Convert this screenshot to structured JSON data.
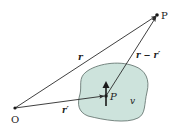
{
  "diagram": {
    "title": "",
    "colors": {
      "background": "#ffffff",
      "line": "#2a2a2a",
      "region_fill": "#cde3dc",
      "region_stroke": "#5a6b66",
      "text": "#222222"
    },
    "points": {
      "origin": {
        "label": "O",
        "x": 15,
        "y": 108
      },
      "field_point": {
        "label": "P",
        "x": 157,
        "y": 15
      },
      "source_point": {
        "label": "P",
        "x": 106,
        "y": 96
      }
    },
    "vectors": {
      "r": {
        "label": "r",
        "from": "origin",
        "to": "field_point"
      },
      "r_prime": {
        "label": "r′",
        "from": "origin",
        "to": "source_point"
      },
      "r_minus_r_prime": {
        "label": "r − r′",
        "from": "source_point",
        "to": "field_point"
      }
    },
    "region": {
      "label": "v"
    },
    "dipole": {
      "label": "",
      "direction": "up"
    }
  }
}
